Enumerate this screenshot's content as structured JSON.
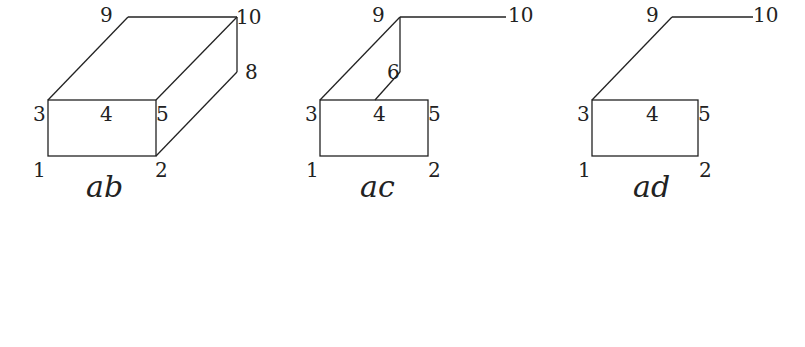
{
  "figures": [
    {
      "caption": "ab",
      "labels": {
        "n1": "1",
        "n2": "2",
        "n3": "3",
        "n4": "4",
        "n5": "5",
        "n8": "8",
        "n9": "9",
        "n10": "10"
      }
    },
    {
      "caption": "ac",
      "labels": {
        "n1": "1",
        "n2": "2",
        "n3": "3",
        "n4": "4",
        "n5": "5",
        "n6": "6",
        "n9": "9",
        "n10": "10"
      }
    },
    {
      "caption": "ad",
      "labels": {
        "n1": "1",
        "n2": "2",
        "n3": "3",
        "n4": "4",
        "n5": "5",
        "n9": "9",
        "n10": "10"
      }
    }
  ]
}
